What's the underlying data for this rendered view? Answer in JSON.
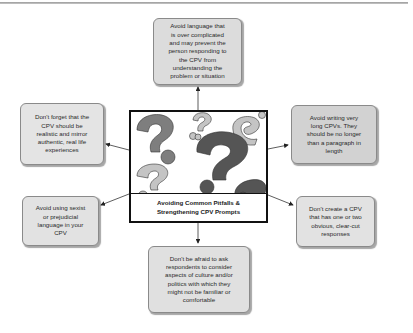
{
  "diagram": {
    "center": {
      "title": "Avoiding Common Pitfalls &\nStrengthening CPV Prompts",
      "image": "question-marks-illustration"
    },
    "nodes": [
      {
        "id": "top",
        "text": "Avoid language that\nis over complicated\nand may prevent the\nperson responding to\nthe CPV from\nunderstanding the\nproblem or situation",
        "fill": "#dcdcdc"
      },
      {
        "id": "left-top",
        "text": "Don't forget that the\nCPV should be\nrealistic and mirror\nauthentic, real life\nexperiences",
        "fill": "#e4e4e4"
      },
      {
        "id": "right-top",
        "text": "Avoid writing very\nlong CPVs. They\nshould be no longer\nthan a paragraph in\nlength",
        "fill": "#d2d2d2"
      },
      {
        "id": "left-bottom",
        "text": "Avoid using sexist\nor prejudicial\nlanguage in your\nCPV",
        "fill": "#e2e2e2"
      },
      {
        "id": "right-bottom",
        "text": "Don't create a CPV\nthat has one or two\nobvious, clear-cut\nresponses",
        "fill": "#e2e2e2"
      },
      {
        "id": "bottom",
        "text": "Don't be afraid to ask\nrespondents to consider\naspects of culture and/or\npolitics with which they\nmight not be familiar or\ncomfortable",
        "fill": "#e0e0e0"
      }
    ],
    "colors": {
      "border": "#8a8a8a",
      "arrow": "#222222",
      "qmark_dark": "#555555",
      "qmark_mid": "#808080",
      "qmark_light": "#c4c4c4"
    }
  }
}
